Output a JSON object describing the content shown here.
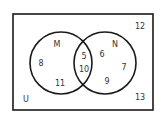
{
  "diagram": {
    "type": "venn",
    "universe_label": "U",
    "sets": [
      {
        "name": "M",
        "only": [
          "8",
          "11"
        ]
      },
      {
        "name": "N",
        "only": [
          "6",
          "7",
          "9"
        ]
      }
    ],
    "intersection": [
      "5",
      "10"
    ],
    "outside": [
      "12",
      "13"
    ]
  },
  "labels": [
    {
      "id": "set-m-label",
      "text": "M",
      "x": 57,
      "y": 45
    },
    {
      "id": "set-n-label",
      "text": "N",
      "x": 115,
      "y": 45
    },
    {
      "id": "m-only-8",
      "text": "8",
      "x": 41,
      "y": 64
    },
    {
      "id": "m-only-11",
      "text": "11",
      "x": 60,
      "y": 84
    },
    {
      "id": "intersection-5",
      "text": "5",
      "x": 84,
      "y": 57
    },
    {
      "id": "intersection-10",
      "text": "10",
      "x": 84,
      "y": 70
    },
    {
      "id": "n-only-6",
      "text": "6",
      "x": 102,
      "y": 55
    },
    {
      "id": "n-only-7",
      "text": "7",
      "x": 124,
      "y": 68
    },
    {
      "id": "n-only-9",
      "text": "9",
      "x": 107,
      "y": 82
    },
    {
      "id": "outside-12",
      "text": "12",
      "x": 140,
      "y": 27
    },
    {
      "id": "outside-13",
      "text": "13",
      "x": 140,
      "y": 98
    },
    {
      "id": "universe-label",
      "text": "U",
      "x": 26,
      "y": 100
    }
  ]
}
